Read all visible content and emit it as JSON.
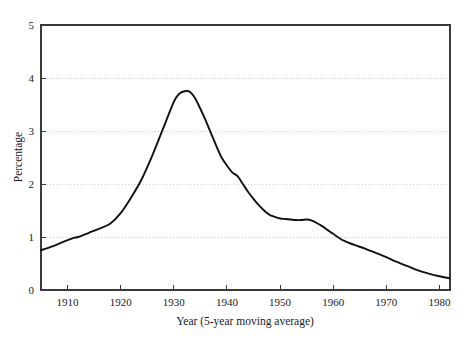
{
  "chart_data": {
    "type": "line",
    "title": "",
    "xlabel": "Year (5-year moving average)",
    "ylabel": "Percentage",
    "xlim": [
      1905,
      1982
    ],
    "ylim": [
      0,
      5
    ],
    "grid": true,
    "legend": "none",
    "xticks": [
      1910,
      1920,
      1930,
      1940,
      1950,
      1960,
      1970,
      1980
    ],
    "xtick_labels": [
      "1910",
      "1920",
      "1930",
      "1940",
      "1950",
      "1960",
      "1970",
      "1980"
    ],
    "yticks": [
      0,
      1,
      2,
      3,
      4,
      5
    ],
    "ytick_labels": [
      "0",
      "1",
      "2",
      "3",
      "4",
      "5"
    ],
    "gridlines_y": [
      1,
      2,
      3,
      4
    ],
    "series": [
      {
        "name": "Percentage",
        "color": "#111111",
        "x": [
          1905,
          1907,
          1909,
          1911,
          1912,
          1914,
          1916,
          1918,
          1920,
          1922,
          1924,
          1926,
          1928,
          1930,
          1931,
          1932,
          1933,
          1934,
          1935,
          1936,
          1937,
          1938,
          1939,
          1940,
          1941,
          1942,
          1943,
          1944,
          1945,
          1946,
          1947,
          1948,
          1949,
          1950,
          1951,
          1952,
          1953,
          1954,
          1955,
          1956,
          1957,
          1958,
          1959,
          1960,
          1962,
          1964,
          1966,
          1968,
          1970,
          1972,
          1974,
          1976,
          1978,
          1980,
          1982
        ],
        "y": [
          0.75,
          0.82,
          0.9,
          0.98,
          1.0,
          1.08,
          1.16,
          1.25,
          1.45,
          1.75,
          2.1,
          2.55,
          3.05,
          3.55,
          3.7,
          3.75,
          3.74,
          3.62,
          3.42,
          3.2,
          2.96,
          2.72,
          2.5,
          2.35,
          2.22,
          2.15,
          2.0,
          1.85,
          1.72,
          1.6,
          1.5,
          1.42,
          1.38,
          1.35,
          1.34,
          1.33,
          1.32,
          1.32,
          1.33,
          1.31,
          1.26,
          1.2,
          1.13,
          1.06,
          0.93,
          0.85,
          0.78,
          0.7,
          0.62,
          0.53,
          0.45,
          0.37,
          0.31,
          0.26,
          0.22
        ]
      }
    ]
  },
  "axes": {
    "ylabel": "Percentage",
    "xlabel": "Year (5-year moving average)"
  }
}
